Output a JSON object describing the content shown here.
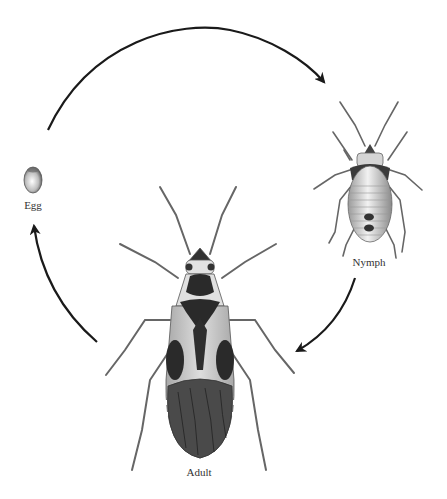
{
  "diagram": {
    "type": "life-cycle",
    "title": "",
    "stages": [
      {
        "id": "egg",
        "label": "Egg"
      },
      {
        "id": "nymph",
        "label": "Nymph"
      },
      {
        "id": "adult",
        "label": "Adult"
      }
    ],
    "arrows": [
      {
        "from": "egg",
        "to": "nymph"
      },
      {
        "from": "nymph",
        "to": "adult"
      },
      {
        "from": "adult",
        "to": "egg"
      }
    ],
    "colors": {
      "background": "#ffffff",
      "arrow": "#1a1a1a",
      "text": "#333333",
      "body_light": "#d8d8d8",
      "body_dark": "#2a2a2a",
      "wing_dark": "#555555"
    }
  }
}
